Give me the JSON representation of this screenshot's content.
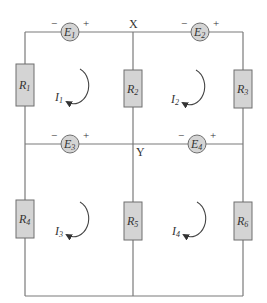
{
  "diagram": {
    "type": "circuit",
    "nodes": {
      "X": "X",
      "Y": "Y"
    },
    "sources": [
      {
        "id": "E1",
        "letter": "E",
        "sub": "1",
        "neg": "−",
        "pos": "+"
      },
      {
        "id": "E2",
        "letter": "E",
        "sub": "2",
        "neg": "−",
        "pos": "+"
      },
      {
        "id": "E3",
        "letter": "E",
        "sub": "3",
        "neg": "−",
        "pos": "+"
      },
      {
        "id": "E4",
        "letter": "E",
        "sub": "4",
        "neg": "−",
        "pos": "+"
      }
    ],
    "resistors": [
      {
        "id": "R1",
        "letter": "R",
        "sub": "1"
      },
      {
        "id": "R2",
        "letter": "R",
        "sub": "2"
      },
      {
        "id": "R3",
        "letter": "R",
        "sub": "3"
      },
      {
        "id": "R4",
        "letter": "R",
        "sub": "4"
      },
      {
        "id": "R5",
        "letter": "R",
        "sub": "5"
      },
      {
        "id": "R6",
        "letter": "R",
        "sub": "6"
      }
    ],
    "loop_currents": [
      {
        "id": "I1",
        "letter": "I",
        "sub": "1",
        "direction": "clockwise"
      },
      {
        "id": "I2",
        "letter": "I",
        "sub": "2",
        "direction": "clockwise"
      },
      {
        "id": "I3",
        "letter": "I",
        "sub": "3",
        "direction": "clockwise"
      },
      {
        "id": "I4",
        "letter": "I",
        "sub": "4",
        "direction": "clockwise"
      }
    ],
    "colors": {
      "wire": "#7a7a7a",
      "component_fill": "#d4d4d4",
      "component_stroke": "#6f6f6f",
      "text": "#333333"
    }
  }
}
